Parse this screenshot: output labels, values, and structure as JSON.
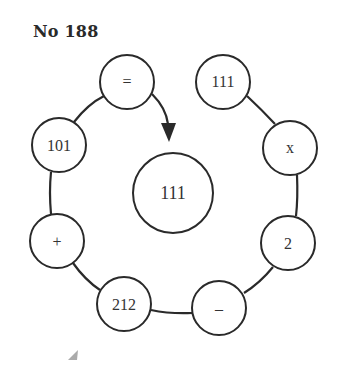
{
  "puzzle": {
    "title": "No 188",
    "nodes": [
      {
        "id": "eq",
        "label": "=",
        "cx": 127,
        "cy": 82,
        "r": 27
      },
      {
        "id": "n111top",
        "label": "111",
        "cx": 223,
        "cy": 82,
        "r": 27
      },
      {
        "id": "times",
        "label": "x",
        "cx": 290,
        "cy": 148,
        "r": 27
      },
      {
        "id": "two",
        "label": "2",
        "cx": 288,
        "cy": 243,
        "r": 27
      },
      {
        "id": "minus",
        "label": "–",
        "cx": 219,
        "cy": 308,
        "r": 27
      },
      {
        "id": "n212",
        "label": "212",
        "cx": 124,
        "cy": 304,
        "r": 27
      },
      {
        "id": "plus",
        "label": "+",
        "cx": 57,
        "cy": 241,
        "r": 27
      },
      {
        "id": "n101",
        "label": "101",
        "cx": 59,
        "cy": 145,
        "r": 27
      }
    ],
    "center": {
      "label": "111",
      "cx": 173,
      "cy": 193,
      "rx": 40,
      "ry": 40
    },
    "colors": {
      "stroke": "#2a2a2a",
      "background": "#ffffff"
    }
  }
}
